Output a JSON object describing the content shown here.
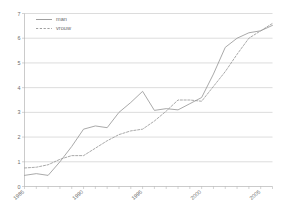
{
  "chart_data": {
    "type": "line",
    "title": "",
    "xlabel": "",
    "ylabel": "",
    "xlim": [
      1985,
      2006
    ],
    "ylim": [
      0,
      7
    ],
    "grid": true,
    "legend_position": "top-left",
    "x": [
      1985,
      1986,
      1987,
      1988,
      1989,
      1990,
      1991,
      1992,
      1993,
      1994,
      1995,
      1996,
      1997,
      1998,
      1999,
      2000,
      2001,
      2002,
      2003,
      2004,
      2005,
      2006
    ],
    "xticks": [
      1985,
      1990,
      1995,
      2000,
      2005
    ],
    "xtick_labels": [
      "1985",
      "1990",
      "1995",
      "2000",
      "2005"
    ],
    "yticks": [
      0,
      1,
      2,
      3,
      4,
      5,
      6,
      7
    ],
    "ytick_labels": [
      "0",
      "1",
      "2",
      "3",
      "4",
      "5",
      "6",
      "7"
    ],
    "series": [
      {
        "name": "man",
        "style": "solid",
        "color": "#9a9a9a",
        "values": [
          0.45,
          0.52,
          0.45,
          1.0,
          1.62,
          2.32,
          2.45,
          2.38,
          3.0,
          3.4,
          3.85,
          3.08,
          3.15,
          3.1,
          3.35,
          3.6,
          4.55,
          5.63,
          6.0,
          6.22,
          6.3,
          6.52
        ]
      },
      {
        "name": "vrouw",
        "style": "dashed",
        "color": "#9a9a9a",
        "values": [
          0.75,
          0.78,
          0.88,
          1.1,
          1.25,
          1.25,
          1.55,
          1.85,
          2.1,
          2.25,
          2.32,
          2.65,
          3.05,
          3.5,
          3.5,
          3.45,
          4.05,
          4.65,
          5.35,
          6.0,
          6.3,
          6.6
        ]
      }
    ]
  },
  "legend": {
    "items": [
      {
        "label": "man",
        "style": "solid"
      },
      {
        "label": "vrouw",
        "style": "dashed"
      }
    ]
  }
}
